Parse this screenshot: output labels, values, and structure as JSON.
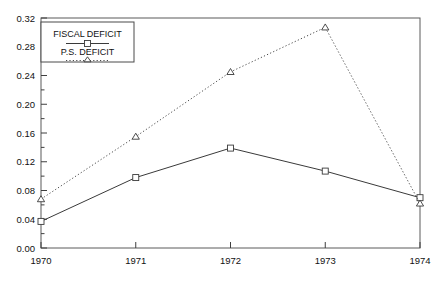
{
  "chart_data": {
    "type": "line",
    "title": "",
    "xlabel": "",
    "ylabel": "",
    "categories": [
      "1970",
      "1971",
      "1972",
      "1973",
      "1974"
    ],
    "x": [
      1970,
      1971,
      1972,
      1973,
      1974
    ],
    "xlim": [
      1970,
      1974
    ],
    "ylim": [
      0.0,
      0.32
    ],
    "ytick_labels": [
      "0.00",
      "0.04",
      "0.08",
      "0.12",
      "0.16",
      "0.20",
      "0.24",
      "0.28",
      "0.32"
    ],
    "ytick_values": [
      0.0,
      0.04,
      0.08,
      0.12,
      0.16,
      0.2,
      0.24,
      0.28,
      0.32
    ],
    "yminor_step": 0.02,
    "grid": false,
    "legend_position": "top-left-inside",
    "series": [
      {
        "name": "FISCAL DEFICIT",
        "values": [
          0.037,
          0.098,
          0.139,
          0.107,
          0.07
        ],
        "marker": "square",
        "line_style": "solid",
        "color": "#3a3a3a"
      },
      {
        "name": "P.S. DEFICIT",
        "values": [
          0.068,
          0.155,
          0.245,
          0.307,
          0.062
        ],
        "marker": "triangle",
        "line_style": "dotted",
        "color": "#4a4a4a"
      }
    ]
  },
  "legend": {
    "entries": [
      {
        "label": "FISCAL DEFICIT",
        "marker": "square",
        "line_style": "solid"
      },
      {
        "label": "P.S. DEFICIT",
        "marker": "triangle",
        "line_style": "dotted"
      }
    ]
  },
  "axes": {
    "y_labels": [
      "0.32",
      "0.28",
      "0.24",
      "0.20",
      "0.16",
      "0.12",
      "0.08",
      "0.04",
      "0.00"
    ],
    "x_labels": [
      "1970",
      "1971",
      "1972",
      "1973",
      "1974"
    ]
  },
  "colors": {
    "frame": "#5a5a5a",
    "series_fiscal": "#3a3a3a",
    "series_ps": "#4a4a4a",
    "background": "#ffffff",
    "text": "#111111"
  }
}
